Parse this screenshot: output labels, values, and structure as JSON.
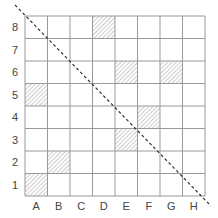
{
  "diagram": {
    "type": "grid",
    "columns": [
      "A",
      "B",
      "C",
      "D",
      "E",
      "F",
      "G",
      "H"
    ],
    "rows": [
      "1",
      "2",
      "3",
      "4",
      "5",
      "6",
      "7",
      "8"
    ],
    "shaded_cells": [
      "A1",
      "B2",
      "E3",
      "F4",
      "A5",
      "E6",
      "G6",
      "D8"
    ],
    "diagonal": {
      "from": "top-left beyond A8",
      "to": "bottom-right beyond H1",
      "style": "dashed"
    },
    "colors": {
      "grid": "#999999",
      "hatch": "#999999",
      "diagonal": "#333333",
      "label": "#444444"
    }
  }
}
